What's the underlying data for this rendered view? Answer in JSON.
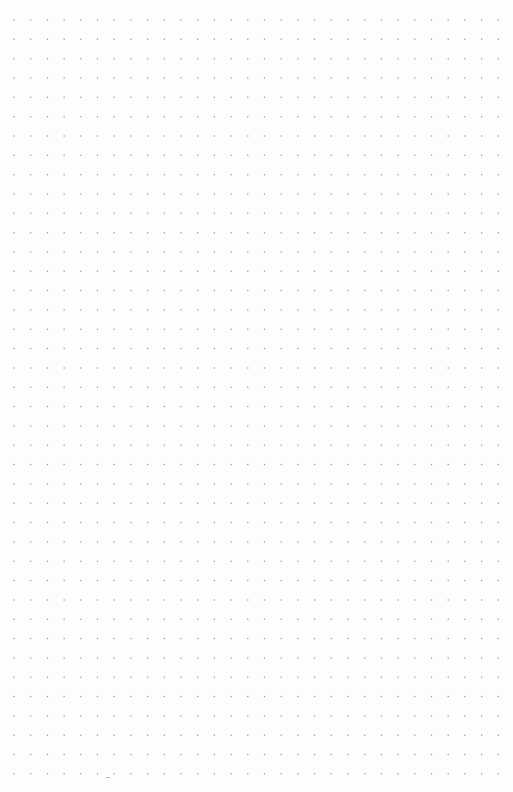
{
  "page": {
    "type": "dot-grid paper",
    "background": "#fdfdfd",
    "dot_color": "#9a9a9a",
    "columns": 30,
    "rows": 40,
    "origin_x": 14,
    "origin_y": 20,
    "spacing_x": 16.7,
    "spacing_y": 19.33,
    "dot_radius": 0.75
  },
  "marks": [
    {
      "x": 106,
      "y": 777
    }
  ]
}
